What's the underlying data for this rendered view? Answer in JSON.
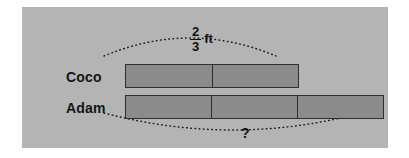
{
  "diagram": {
    "type": "tape-diagram",
    "background_color": "#b4b4b4",
    "bar_fill_color": "#8b8b8b",
    "bar_border_color": "#2e2e2e",
    "text_color": "#111111",
    "rows": [
      {
        "label": "Coco",
        "segments": 2,
        "measure_label": {
          "numerator": "2",
          "denominator": "3",
          "unit": "ft",
          "position": "above"
        }
      },
      {
        "label": "Adam",
        "segments": 3,
        "measure_label": {
          "text": "?",
          "position": "below"
        }
      }
    ]
  }
}
